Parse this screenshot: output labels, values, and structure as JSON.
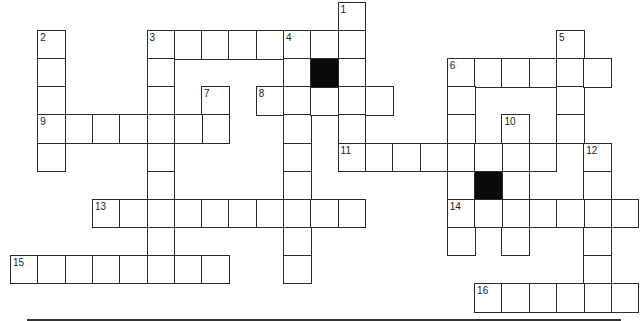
{
  "puzzle": {
    "type": "crossword",
    "grid_origin": {
      "x": 10,
      "y": 2
    },
    "cell_size": {
      "w": 27.3,
      "h": 28.1
    },
    "colors": {
      "line": "#2a2a2a",
      "black_cell": "#0a0a0a",
      "background": "#ffffff"
    },
    "entries": [
      {
        "number": "1",
        "direction": "down",
        "col": 12,
        "row": 0,
        "length": 6
      },
      {
        "number": "2",
        "direction": "down",
        "col": 1,
        "row": 1,
        "length": 5
      },
      {
        "number": "3",
        "direction": "across",
        "col": 5,
        "row": 1,
        "length": 8
      },
      {
        "number": "3",
        "direction": "down",
        "col": 5,
        "row": 1,
        "length": 9
      },
      {
        "number": "4",
        "direction": "down",
        "col": 10,
        "row": 1,
        "length": 9
      },
      {
        "number": "5",
        "direction": "down",
        "col": 20,
        "row": 1,
        "length": 5
      },
      {
        "number": "6",
        "direction": "across",
        "col": 16,
        "row": 2,
        "length": 6
      },
      {
        "number": "6",
        "direction": "down",
        "col": 16,
        "row": 2,
        "length": 7
      },
      {
        "number": "7",
        "direction": "down",
        "col": 7,
        "row": 3,
        "length": 2
      },
      {
        "number": "8",
        "direction": "across",
        "col": 9,
        "row": 3,
        "length": 5
      },
      {
        "number": "9",
        "direction": "across",
        "col": 1,
        "row": 4,
        "length": 7
      },
      {
        "number": "10",
        "direction": "down",
        "col": 18,
        "row": 4,
        "length": 5
      },
      {
        "number": "11",
        "direction": "across",
        "col": 12,
        "row": 5,
        "length": 8
      },
      {
        "number": "12",
        "direction": "down",
        "col": 21,
        "row": 5,
        "length": 6
      },
      {
        "number": "13",
        "direction": "across",
        "col": 3,
        "row": 7,
        "length": 10
      },
      {
        "number": "14",
        "direction": "across",
        "col": 16,
        "row": 7,
        "length": 7
      },
      {
        "number": "15",
        "direction": "across",
        "col": 0,
        "row": 9,
        "length": 8
      },
      {
        "number": "16",
        "direction": "across",
        "col": 17,
        "row": 10,
        "length": 6
      }
    ],
    "black_cells": [
      {
        "col": 11,
        "row": 2
      },
      {
        "col": 17,
        "row": 6
      }
    ],
    "open_bottom_cells": [
      {
        "col": 20,
        "row": 5
      }
    ]
  }
}
